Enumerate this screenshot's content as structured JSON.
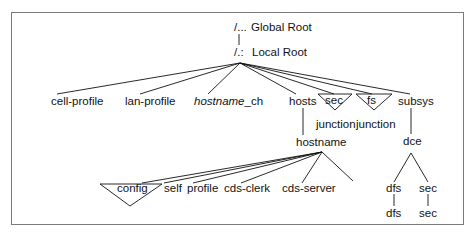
{
  "diagram": {
    "roots": {
      "global": {
        "symbol": "/...",
        "label": "Global Root"
      },
      "local": {
        "symbol": "/.:",
        "label": "Local Root"
      }
    },
    "level1": [
      {
        "id": "cell-profile",
        "label": "cell-profile"
      },
      {
        "id": "lan-profile",
        "label": "lan-profile"
      },
      {
        "id": "hostname-ch",
        "label_italic": "hostname",
        "label_suffix": "_ch"
      },
      {
        "id": "hosts",
        "label": "hosts"
      },
      {
        "id": "sec",
        "label": "sec",
        "type": "junction",
        "sublabel": "junction"
      },
      {
        "id": "fs",
        "label": "fs",
        "type": "junction",
        "sublabel": "junction"
      },
      {
        "id": "subsys",
        "label": "subsys"
      }
    ],
    "hosts_child": {
      "label": "hostname"
    },
    "hostname_children": [
      {
        "id": "config",
        "label": "config",
        "type": "junction"
      },
      {
        "id": "self",
        "label": "self"
      },
      {
        "id": "profile",
        "label": "profile"
      },
      {
        "id": "cds-clerk",
        "label": "cds-clerk"
      },
      {
        "id": "cds-server",
        "label": "cds-server"
      }
    ],
    "subsys_child": {
      "label": "dce"
    },
    "dce_children": [
      {
        "id": "dfs",
        "label": "dfs",
        "child": "dfs"
      },
      {
        "id": "sec2",
        "label": "sec",
        "child": "sec"
      }
    ],
    "colors": {
      "line": "#111111",
      "frame": "#7a7a7a",
      "text": "#111111"
    }
  }
}
